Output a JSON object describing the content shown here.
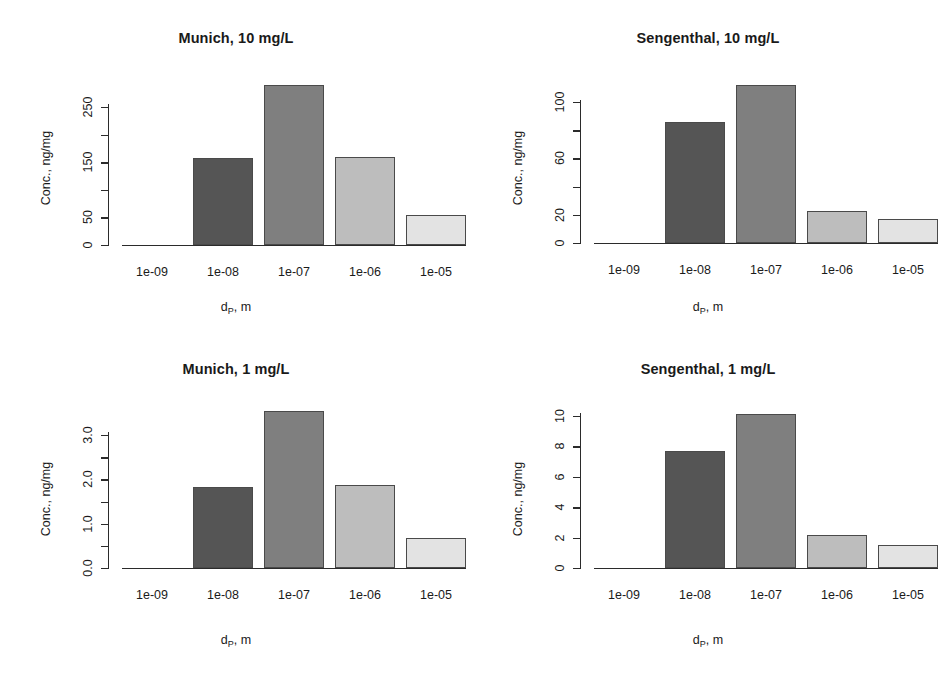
{
  "figure": {
    "ylabel": "Conc., ng/mg",
    "xlabel_main": "d",
    "xlabel_sub": "P",
    "xlabel_tail": ", m",
    "bar_colors": [
      "#f2f2f2",
      "#555555",
      "#7f7f7f",
      "#bdbdbd",
      "#e3e3e3"
    ],
    "axis_color": "#2b2b2b"
  },
  "chart_data": [
    {
      "type": "bar",
      "panel": "top-left",
      "title": "Munich, 10 mg/L",
      "xlabel": "d_P, m",
      "ylabel": "Conc., ng/mg",
      "categories": [
        "1e-09",
        "1e-08",
        "1e-07",
        "1e-06",
        "1e-05"
      ],
      "values": [
        0.5,
        157,
        290,
        160,
        55
      ],
      "ylim": [
        0,
        290
      ],
      "yticks": [
        0,
        50,
        150,
        250
      ],
      "yticks_minor": [
        100,
        200
      ],
      "ytick_labels": [
        "0",
        "50",
        "150",
        "250"
      ],
      "grid": false,
      "legend": "none"
    },
    {
      "type": "bar",
      "panel": "top-right",
      "title": "Sengenthal, 10 mg/L",
      "xlabel": "d_P, m",
      "ylabel": "Conc., ng/mg",
      "categories": [
        "1e-09",
        "1e-08",
        "1e-07",
        "1e-06",
        "1e-05"
      ],
      "values": [
        0.2,
        86,
        112,
        22.5,
        17
      ],
      "ylim": [
        0,
        112
      ],
      "yticks": [
        0,
        20,
        60,
        100
      ],
      "yticks_minor": [
        40,
        80
      ],
      "ytick_labels": [
        "0",
        "20",
        "60",
        "100"
      ],
      "grid": false,
      "legend": "none"
    },
    {
      "type": "bar",
      "panel": "bottom-left",
      "title": "Munich, 1 mg/L",
      "xlabel": "d_P, m",
      "ylabel": "Conc., ng/mg",
      "categories": [
        "1e-09",
        "1e-08",
        "1e-07",
        "1e-06",
        "1e-05"
      ],
      "values": [
        0.005,
        1.82,
        3.55,
        1.88,
        0.68
      ],
      "ylim": [
        0,
        3.55
      ],
      "yticks": [
        0.0,
        1.0,
        2.0,
        3.0
      ],
      "yticks_minor": [
        0.5,
        1.5,
        2.5
      ],
      "ytick_labels": [
        "0.0",
        "1.0",
        "2.0",
        "3.0"
      ],
      "grid": false,
      "legend": "none"
    },
    {
      "type": "bar",
      "panel": "bottom-right",
      "title": "Sengenthal, 1 mg/L",
      "xlabel": "d_P, m",
      "ylabel": "Conc., ng/mg",
      "categories": [
        "1e-09",
        "1e-08",
        "1e-07",
        "1e-06",
        "1e-05"
      ],
      "values": [
        0.01,
        7.7,
        10.1,
        2.15,
        1.5
      ],
      "ylim": [
        0,
        10.1
      ],
      "yticks": [
        0,
        2,
        4,
        6,
        8,
        10
      ],
      "yticks_minor": [],
      "ytick_labels": [
        "0",
        "2",
        "4",
        "6",
        "8",
        "10"
      ],
      "grid": false,
      "legend": "none"
    }
  ]
}
